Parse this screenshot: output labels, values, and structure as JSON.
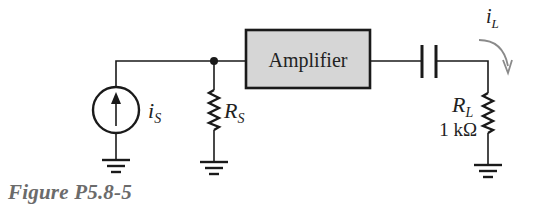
{
  "figure": {
    "caption": "Figure P5.8-5",
    "colors": {
      "line": "#1a1a1a",
      "amplifier_fill": "#d6d6d6",
      "caption": "#6b6b6b",
      "arrow": "#8a8a8a"
    }
  },
  "components": {
    "current_source": {
      "symbol": "i",
      "subscript": "S"
    },
    "source_resistor": {
      "symbol": "R",
      "subscript": "S"
    },
    "amplifier": {
      "label": "Amplifier"
    },
    "coupling_capacitor": {
      "label": ""
    },
    "load_resistor": {
      "symbol": "R",
      "subscript": "L",
      "value": "1 kΩ"
    },
    "load_current": {
      "symbol": "i",
      "subscript": "L"
    }
  }
}
